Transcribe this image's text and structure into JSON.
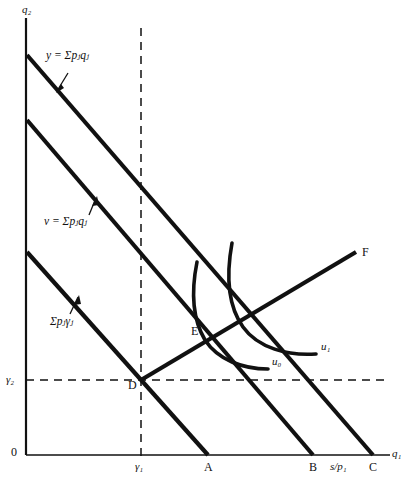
{
  "figure": {
    "type": "economics-indifference-curve-diagram",
    "background": "#ffffff",
    "ink": "#000000"
  },
  "axes": {
    "y_label": "q₂",
    "x_label": "q₁",
    "origin_label": "0",
    "x_axis_y": 455,
    "y_axis_x": 26,
    "x_axis_end": 390,
    "y_axis_top": 18
  },
  "budget_lines": [
    {
      "id": "line-y",
      "label": "y = Σpⱼqⱼ",
      "label_x": 46,
      "label_y": 56,
      "y_intercept_px": 55,
      "x_intercept_px": 373
    },
    {
      "id": "line-v",
      "label": "v = Σpⱼqⱼ",
      "label_x": 44,
      "label_y": 222,
      "y_intercept_px": 120,
      "x_intercept_px": 313
    },
    {
      "id": "line-gamma",
      "label": "Σpⱼγⱼ",
      "label_x": 50,
      "label_y": 322,
      "y_intercept_px": 252,
      "x_intercept_px": 208
    }
  ],
  "points": [
    {
      "id": "point-D",
      "label": "D",
      "x": 141,
      "y": 380,
      "label_dx": -12,
      "label_dy": 6
    },
    {
      "id": "point-E",
      "label": "E",
      "x": 205,
      "y": 332,
      "label_dx": -13,
      "label_dy": -2
    },
    {
      "id": "point-A",
      "label": "A",
      "x": 208,
      "y": 455
    },
    {
      "id": "point-B",
      "label": "B",
      "x": 313,
      "y": 455
    },
    {
      "id": "point-C",
      "label": "C",
      "x": 373,
      "y": 455
    },
    {
      "id": "point-F",
      "label": "F",
      "x": 356,
      "y": 252,
      "label_dx": 7,
      "label_dy": -4
    }
  ],
  "tick_labels": {
    "gamma1": "γ₁",
    "gamma1_x": 141,
    "gamma2": "γ₂",
    "gamma2_y": 380,
    "s_over_p1": "s/p₁",
    "s_over_p1_x": 342
  },
  "indifference_curves": [
    {
      "id": "curve-u0",
      "label": "u₀",
      "label_x": 272,
      "label_y": 362
    },
    {
      "id": "curve-u1",
      "label": "u₁",
      "label_x": 321,
      "label_y": 347
    }
  ],
  "dashed_guides": {
    "vertical_gamma1": {
      "x": 141,
      "from_y": 28,
      "to_y": 462
    },
    "horizontal_gamma2": {
      "y": 380,
      "from_x": 26,
      "to_x": 390
    }
  },
  "expansion_path": {
    "id": "line-DF",
    "from": {
      "x": 141,
      "y": 380
    },
    "to": {
      "x": 356,
      "y": 252
    }
  }
}
